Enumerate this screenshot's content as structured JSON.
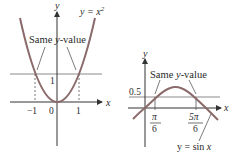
{
  "colors": {
    "curve": "#8a6a6a",
    "axis": "#333333",
    "hline": "#8a8a8a",
    "text": "#2a2a2a"
  },
  "left": {
    "axis_x_label": "x",
    "axis_y_label": "y",
    "curve_label": "y = x",
    "curve_label_exp": "2",
    "annotation": "Same y-value",
    "annotation_prefix": "Same ",
    "annotation_italic": "y",
    "annotation_suffix": "-value",
    "ticks": {
      "neg_one": "−1",
      "zero": "0",
      "one": "1",
      "y_one": "1"
    }
  },
  "right": {
    "axis_x_label": "x",
    "axis_y_label": "y",
    "curve_label": "y = sin x",
    "curve_label_prefix": "y = sin ",
    "curve_label_var": "x",
    "annotation_prefix": "Same ",
    "annotation_italic": "y",
    "annotation_suffix": "-value",
    "y_tick": "0.5",
    "x_ticks": [
      {
        "num": "π",
        "den": "6"
      },
      {
        "num": "5π",
        "den": "6"
      }
    ]
  }
}
